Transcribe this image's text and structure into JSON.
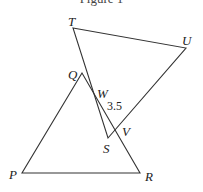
{
  "figure": {
    "caption": "Figure 1",
    "stroke_color": "#333333",
    "points": {
      "T": {
        "label": "T",
        "x": 73,
        "y": 28
      },
      "U": {
        "label": "U",
        "x": 186,
        "y": 48
      },
      "Q": {
        "label": "Q",
        "x": 82,
        "y": 73
      },
      "W": {
        "label": "W",
        "x": 96,
        "y": 98
      },
      "S": {
        "label": "S",
        "x": 108,
        "y": 138
      },
      "V": {
        "label": "V",
        "x": 114,
        "y": 133
      },
      "P": {
        "label": "P",
        "x": 22,
        "y": 173
      },
      "R": {
        "label": "R",
        "x": 140,
        "y": 173
      }
    },
    "segments": [
      [
        "T",
        "U"
      ],
      [
        "T",
        "S"
      ],
      [
        "U",
        "S"
      ],
      [
        "Q",
        "P"
      ],
      [
        "Q",
        "R"
      ],
      [
        "P",
        "R"
      ]
    ],
    "measurement": {
      "label": "3.5",
      "segment": "WV"
    }
  }
}
